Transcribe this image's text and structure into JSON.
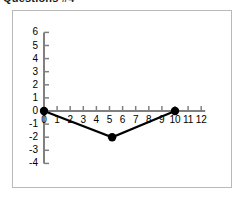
{
  "title": {
    "text": "Questions #4",
    "cropped": true
  },
  "chart_data": {
    "type": "line",
    "title": "Questions #4",
    "xlabel": "",
    "ylabel": "",
    "x": [
      0,
      5.2,
      10
    ],
    "values": [
      0,
      -2,
      0
    ],
    "points": [
      {
        "x": 0,
        "y": 0
      },
      {
        "x": 5.2,
        "y": -2
      },
      {
        "x": 10,
        "y": 0
      }
    ],
    "series": [
      {
        "name": "series-1",
        "x": [
          0,
          5.2,
          10
        ],
        "values": [
          0,
          -2,
          0
        ]
      }
    ],
    "xlim": [
      0,
      12
    ],
    "ylim": [
      -4,
      6
    ],
    "xticks": [
      0,
      1,
      2,
      3,
      4,
      5,
      6,
      7,
      8,
      9,
      10,
      11,
      12
    ],
    "yticks": [
      6,
      5,
      4,
      3,
      2,
      1,
      0,
      -1,
      -2,
      -3,
      -4
    ],
    "xtick_labels": [
      "0",
      "1",
      "2",
      "3",
      "4",
      "5",
      "6",
      "7",
      "8",
      "9",
      "10",
      "11",
      "12"
    ],
    "ytick_labels": [
      "6",
      "5",
      "4",
      "3",
      "2",
      "1",
      "0",
      "-1",
      "-2",
      "-3",
      "-4"
    ],
    "grid": false,
    "legend": false,
    "marker": "filled-circle",
    "line_color": "#000000",
    "marker_color": "#000000",
    "axis_color": "#808080",
    "frame_color": "#b9b9b9",
    "background": "#ffffff"
  }
}
